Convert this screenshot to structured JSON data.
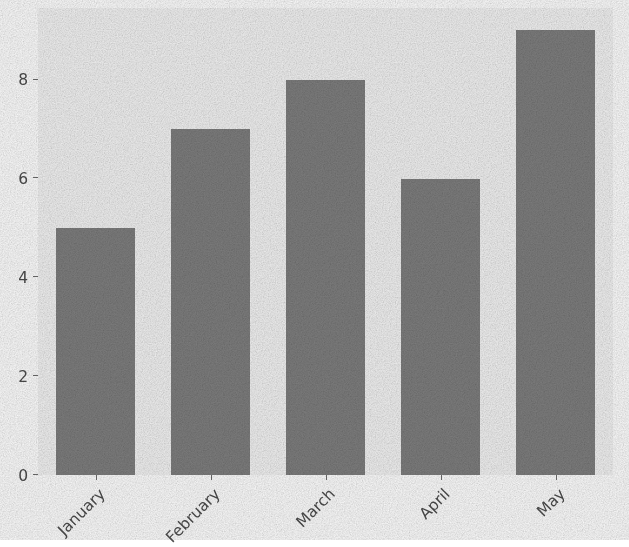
{
  "chart_data": {
    "type": "bar",
    "title": "",
    "subtitle": "",
    "xlabel": "",
    "ylabel": "",
    "categories": [
      "January",
      "February",
      "March",
      "April",
      "May"
    ],
    "values": [
      5,
      7,
      8,
      6,
      9
    ],
    "series": [
      {
        "name": "",
        "values": [
          5,
          7,
          8,
          6,
          9
        ]
      }
    ],
    "ylim": [
      0,
      9.45
    ],
    "xlim": [
      -0.5,
      4.5
    ],
    "y_ticks": [
      0,
      2,
      4,
      6,
      8
    ],
    "y_tick_labels": [
      "0",
      "2",
      "4",
      "6",
      "8"
    ],
    "x_tick_labels": [
      "January",
      "February",
      "March",
      "April",
      "May"
    ],
    "x_tick_rotation": -45,
    "grid": false,
    "legend": null,
    "legend_position": "none",
    "annotations": [],
    "colors": {
      "bar": "#7f7f7f",
      "plot_background": "#f4f4f4",
      "figure_background": "#ffffff",
      "tick_label": "#4d4d4d",
      "tick_mark": "#6e6e6e"
    },
    "style_notes": "grainy / noisy raster rendering"
  },
  "axes": {
    "y_axis_name": "y-axis",
    "x_axis_name": "x-axis"
  }
}
